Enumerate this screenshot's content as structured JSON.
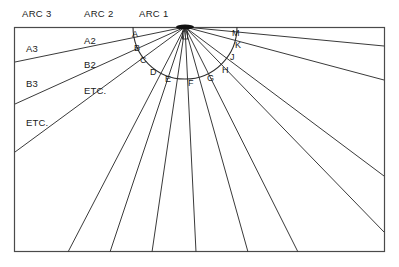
{
  "figure": {
    "background_color": "#ffffff",
    "line_color": "#3a3a3a",
    "frame": {
      "x": 14,
      "y": 27,
      "width": 371,
      "height": 225
    }
  },
  "hub": {
    "label": "hub-point",
    "x": 185,
    "y": 27
  },
  "arc_headers": [
    {
      "name": "arc-3-header",
      "text": "ARC 3",
      "x": 22,
      "y": 9
    },
    {
      "name": "arc-2-header",
      "text": "ARC 2",
      "x": 84,
      "y": 9
    },
    {
      "name": "arc-1-header",
      "text": "ARC 1",
      "x": 139,
      "y": 9
    }
  ],
  "zone_labels_arc3": [
    {
      "text": "A3",
      "x": 26,
      "y": 44
    },
    {
      "text": "B3",
      "x": 26,
      "y": 79
    },
    {
      "text": "ETC.",
      "x": 26,
      "y": 118
    }
  ],
  "zone_labels_arc2": [
    {
      "text": "A2",
      "x": 84,
      "y": 36
    },
    {
      "text": "B2",
      "x": 84,
      "y": 60
    },
    {
      "text": "ETC.",
      "x": 84,
      "y": 86
    }
  ],
  "arc1": {
    "name": "arc-1-semicircle",
    "center_x": 185,
    "center_y": 27,
    "radius": 52,
    "point_labels": [
      {
        "text": "A",
        "x": 132,
        "y": 30
      },
      {
        "text": "B",
        "x": 134,
        "y": 44
      },
      {
        "text": "C",
        "x": 140,
        "y": 56
      },
      {
        "text": "D",
        "x": 150,
        "y": 68
      },
      {
        "text": "E",
        "x": 165,
        "y": 75
      },
      {
        "text": "F",
        "x": 188,
        "y": 79
      },
      {
        "text": "G",
        "x": 207,
        "y": 74
      },
      {
        "text": "H",
        "x": 222,
        "y": 66
      },
      {
        "text": "J",
        "x": 230,
        "y": 53
      },
      {
        "text": "K",
        "x": 235,
        "y": 41
      },
      {
        "text": "M",
        "x": 232,
        "y": 29
      }
    ]
  },
  "rays": {
    "name": "radial-ray-set",
    "count": 12,
    "description": "Straight lines radiating from hub to frame edges"
  }
}
